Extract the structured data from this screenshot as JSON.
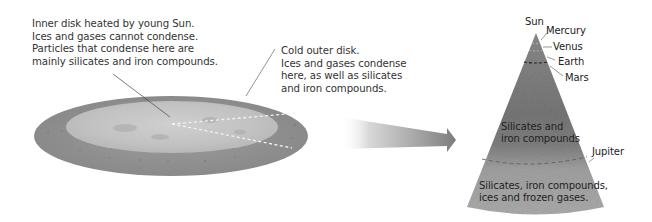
{
  "inner_disk_caption": {
    "lines": [
      "Inner disk heated by young Sun.",
      "Ices and gases cannot condense.",
      "Particles that condense here are",
      "mainly silicates and iron compounds."
    ]
  },
  "outer_disk_caption": {
    "lines": [
      "Cold outer disk.",
      "Ices and gases condense",
      "here, as well as silicates",
      "and iron compounds."
    ]
  },
  "cone": {
    "sun_label": "Sun",
    "planets": [
      "Mercury",
      "Venus",
      "Earth",
      "Mars"
    ],
    "jupiter_label": "Jupiter",
    "inner_region": {
      "lines": [
        "Silicates and",
        "iron compounds"
      ]
    },
    "outer_region": {
      "lines": [
        "Silicates, iron compounds,",
        "ices and frozen gases."
      ]
    }
  },
  "colors": {
    "outer_disk": "#8e8e8e",
    "inner_disk": "#c4c4c4",
    "cone_top": "#7a7a7a",
    "cone_bottom": "#a9a9a9",
    "arrow": "#8a8a8a",
    "leader_line": "#555555"
  }
}
